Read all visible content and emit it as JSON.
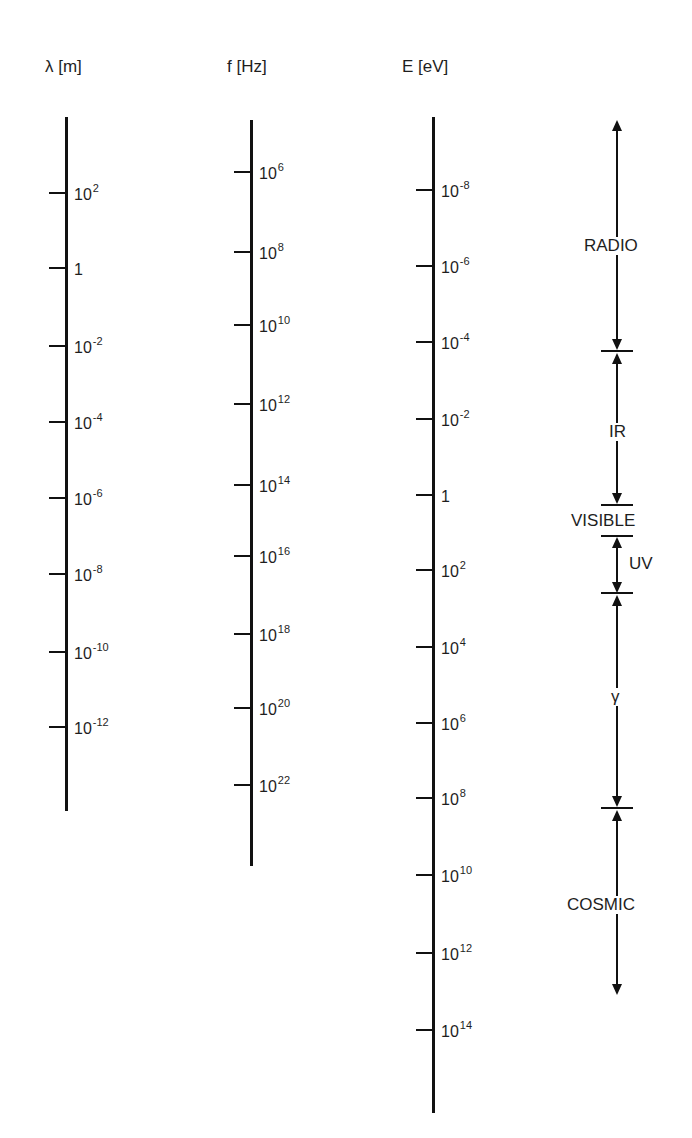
{
  "headers": {
    "wavelength": "λ [m]",
    "frequency": "f [Hz]",
    "energy": "E [eV]"
  },
  "wavelength_ticks": [
    {
      "base": "10",
      "exp": "2"
    },
    {
      "base": "1",
      "exp": ""
    },
    {
      "base": "10",
      "exp": "-2"
    },
    {
      "base": "10",
      "exp": "-4"
    },
    {
      "base": "10",
      "exp": "-6"
    },
    {
      "base": "10",
      "exp": "-8"
    },
    {
      "base": "10",
      "exp": "-10"
    },
    {
      "base": "10",
      "exp": "-12"
    }
  ],
  "frequency_ticks": [
    {
      "base": "10",
      "exp": "6"
    },
    {
      "base": "10",
      "exp": "8"
    },
    {
      "base": "10",
      "exp": "10"
    },
    {
      "base": "10",
      "exp": "12"
    },
    {
      "base": "10",
      "exp": "14"
    },
    {
      "base": "10",
      "exp": "16"
    },
    {
      "base": "10",
      "exp": "18"
    },
    {
      "base": "10",
      "exp": "20"
    },
    {
      "base": "10",
      "exp": "22"
    }
  ],
  "energy_ticks": [
    {
      "base": "10",
      "exp": "-8"
    },
    {
      "base": "10",
      "exp": "-6"
    },
    {
      "base": "10",
      "exp": "-4"
    },
    {
      "base": "10",
      "exp": "-2"
    },
    {
      "base": "1",
      "exp": ""
    },
    {
      "base": "10",
      "exp": "2"
    },
    {
      "base": "10",
      "exp": "4"
    },
    {
      "base": "10",
      "exp": "6"
    },
    {
      "base": "10",
      "exp": "8"
    },
    {
      "base": "10",
      "exp": "10"
    },
    {
      "base": "10",
      "exp": "12"
    },
    {
      "base": "10",
      "exp": "14"
    }
  ],
  "bands": {
    "radio": "RADIO",
    "ir": "IR",
    "visible": "VISIBLE",
    "uv": "UV",
    "gamma": "γ",
    "cosmic": "COSMIC"
  }
}
